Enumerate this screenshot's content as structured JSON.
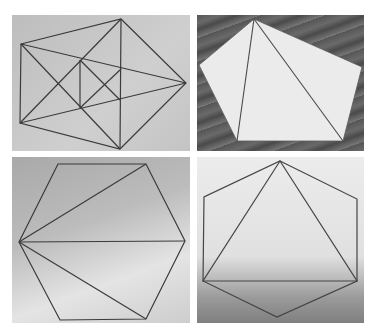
{
  "figure": {
    "layout": "2x2 grid of photographs",
    "panels": [
      {
        "id": "top-left",
        "subject": "pentagon-with-all-diagonals-and-inner-lines",
        "background": "gray paper",
        "line_color": "#3a3a3a"
      },
      {
        "id": "top-right",
        "subject": "paper-pentagon-divided-into-three-triangles",
        "background": "wood grain",
        "fill_color": "#e8e8e8",
        "line_color": "#4a4a4a"
      },
      {
        "id": "bottom-left",
        "subject": "hexagon-divided-into-triangles-from-one-vertex",
        "background": "gray paper gradient",
        "line_color": "#3a3a3a"
      },
      {
        "id": "bottom-right",
        "subject": "hexagon-with-inscribed-triangle",
        "background": "light gray paper gradient",
        "line_color": "#444444"
      }
    ]
  }
}
